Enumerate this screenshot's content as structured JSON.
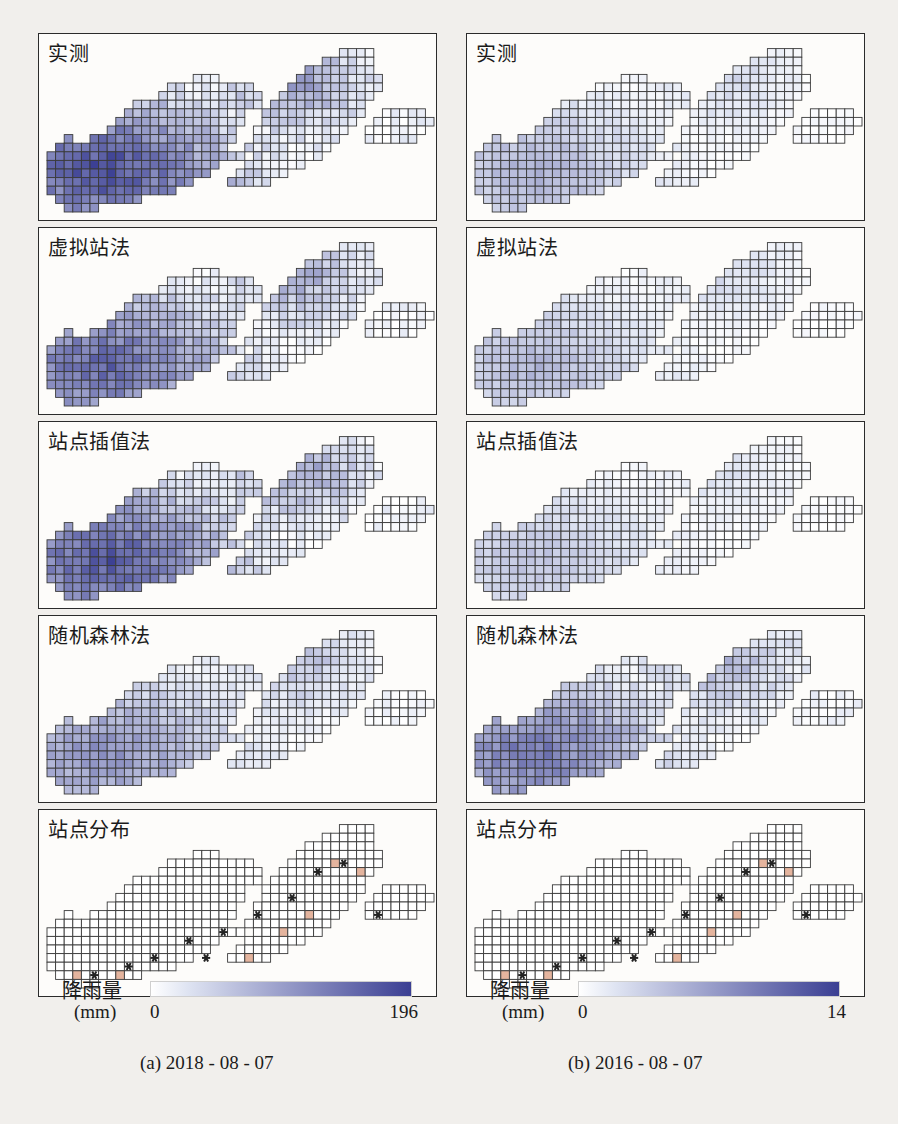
{
  "figure": {
    "background": "#f1efec",
    "panel_border": "#2b2b2b"
  },
  "columns": [
    {
      "id": "a",
      "caption": "(a) 2018 - 08 - 07",
      "legend": {
        "title": "降雨量",
        "unit": "(mm)",
        "min": "0",
        "max": "196",
        "ramp_start": "#dfe4f2",
        "ramp_end": "#3b3f93"
      },
      "panels": [
        {
          "label": "实测",
          "name": "observed",
          "seed": 11,
          "intensity": 0.92,
          "lowEdge": 0.52
        },
        {
          "label": "虚拟站法",
          "name": "virtual-station",
          "seed": 23,
          "intensity": 0.8,
          "lowEdge": 0.46
        },
        {
          "label": "站点插值法",
          "name": "station-interpolation",
          "seed": 37,
          "intensity": 0.86,
          "lowEdge": 0.5
        },
        {
          "label": "随机森林法",
          "name": "random-forest",
          "seed": 51,
          "intensity": 0.58,
          "lowEdge": 0.4
        },
        {
          "label": "站点分布",
          "name": "station-distribution",
          "stations": true
        }
      ]
    },
    {
      "id": "b",
      "caption": "(b) 2016 - 08 - 07",
      "legend": {
        "title": "降雨量",
        "unit": "(mm)",
        "min": "0",
        "max": "14",
        "ramp_start": "#dfe4f2",
        "ramp_end": "#3b3f93"
      },
      "panels": [
        {
          "label": "实测",
          "name": "observed",
          "seed": 71,
          "intensity": 0.42,
          "lowEdge": 0.22
        },
        {
          "label": "虚拟站法",
          "name": "virtual-station",
          "seed": 83,
          "intensity": 0.4,
          "lowEdge": 0.2
        },
        {
          "label": "站点插值法",
          "name": "station-interpolation",
          "seed": 97,
          "intensity": 0.34,
          "lowEdge": 0.18
        },
        {
          "label": "随机森林法",
          "name": "random-forest",
          "seed": 109,
          "intensity": 0.7,
          "lowEdge": 0.48
        },
        {
          "label": "站点分布",
          "name": "station-distribution",
          "stations": true
        }
      ]
    }
  ],
  "chart_data": {
    "type": "heatmap",
    "variable": "降雨量",
    "unit": "mm",
    "panel_methods": [
      "实测",
      "虚拟站法",
      "站点插值法",
      "随机森林法",
      "站点分布"
    ],
    "subplots": [
      {
        "label": "(a) 2018 - 08 - 07",
        "vmin": 0,
        "vmax": 196
      },
      {
        "label": "(b) 2016 - 08 - 07",
        "vmin": 0,
        "vmax": 14
      }
    ],
    "colorbar": {
      "min": 0,
      "max_a": 196,
      "max_b": 14,
      "start_color": "#dfe4f2",
      "end_color": "#3b3f93"
    },
    "grid": true,
    "legend_position": "bottom",
    "station_marker": "star",
    "station_cell_color": "#e4b49e",
    "cell_size_px": 8.6,
    "grid_cols": 46,
    "grid_rows": 22
  }
}
